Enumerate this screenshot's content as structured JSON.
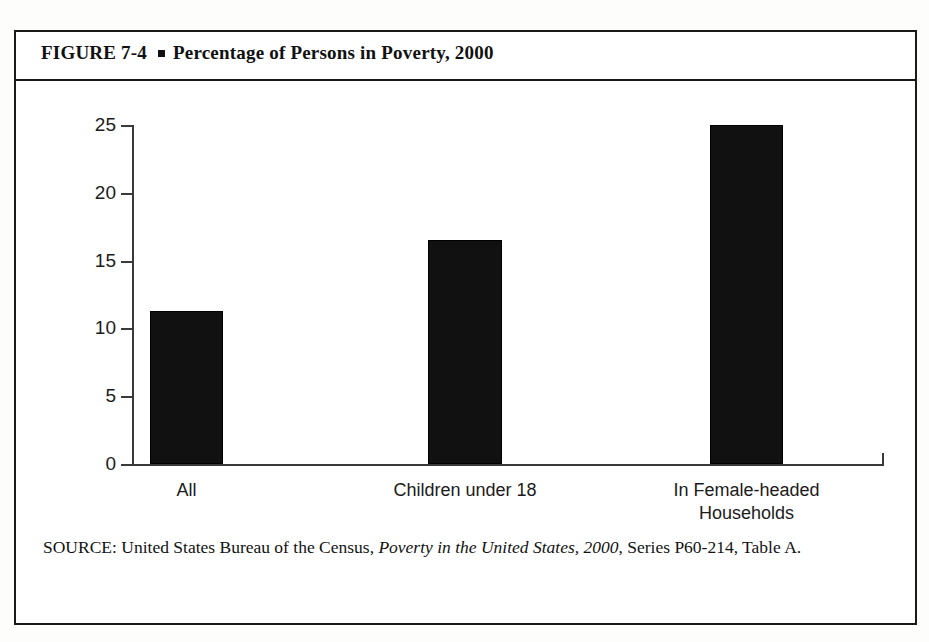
{
  "figure": {
    "number_label": "FIGURE 7-4",
    "bullet": "square-bullet",
    "title": "Percentage of Persons in Poverty, 2000",
    "source_prefix": "SOURCE: United States Bureau of the Census, ",
    "source_italic": "Poverty in the United States, 2000",
    "source_suffix": ", Series P60-214, Table A."
  },
  "chart_data": {
    "type": "bar",
    "title": "Percentage of Persons in Poverty, 2000",
    "xlabel": "",
    "ylabel": "",
    "ylim": [
      0,
      25
    ],
    "yticks": [
      0,
      5,
      10,
      15,
      20,
      25
    ],
    "ytick_labels": [
      "0",
      "5",
      "10",
      "15",
      "20",
      "25"
    ],
    "grid": false,
    "legend": "none",
    "categories": [
      "All",
      "Children under 18",
      "In Female-headed\nHouseholds"
    ],
    "values": [
      11.3,
      16.5,
      25.0
    ],
    "bar_color": "#111111",
    "axis_color": "#3a3a3a"
  }
}
